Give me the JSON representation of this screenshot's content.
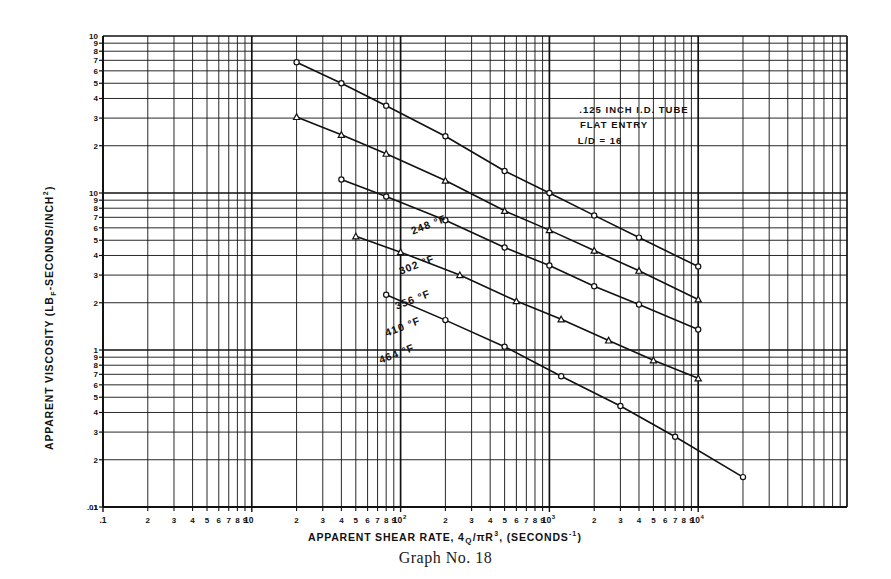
{
  "caption": "Graph No. 18",
  "chart_data": {
    "type": "line",
    "title": "",
    "xlabel": "APPARENT SHEAR RATE, 4Q/πR³, (SECONDS⁻¹)",
    "ylabel": "APPARENT VISCOSITY (LB F -SECONDS/INCH²)",
    "ylabel_parts": {
      "pre": "APPARENT VISCOSITY (LB",
      "sub": "F",
      "post": " -SECONDS/INCH",
      "sup": "2",
      "tail": " )"
    },
    "xlabel_parts": {
      "pre": "APPARENT SHEAR RATE, 4",
      "q": "Q",
      "slash": "/πR",
      "sup": "3",
      "post": ", (SECONDS",
      "sup2": "-1",
      "tail": ")"
    },
    "xscale": "log",
    "yscale": "log",
    "xlim": [
      0.1,
      10000
    ],
    "ylim": [
      0.01,
      10
    ],
    "grid": true,
    "legend_position": "inline-labels",
    "x_decade_labels": [
      ".1",
      "10",
      "10",
      "10",
      "10"
    ],
    "x_decade_exponents": [
      "",
      "",
      "2",
      "3",
      "4"
    ],
    "x_minor_labels": [
      "2",
      "3",
      "4",
      "5",
      "6",
      "7",
      "8",
      "9",
      "10"
    ],
    "y_tick_labels_top_decade": [
      "10",
      "9",
      "8",
      "7",
      "6",
      "5",
      "4",
      "3",
      "2"
    ],
    "y_tick_labels_mid_decade": [
      "1",
      "9",
      "8",
      "7",
      "6",
      "5",
      "4",
      "3",
      "2"
    ],
    "y_tick_labels_low_decade": [
      ".1",
      "9",
      "8",
      "7",
      "6",
      "5",
      "4",
      "3",
      "2"
    ],
    "y_bottom_label": ".01",
    "annotation": {
      "line1": ".125 INCH I.D. TUBE",
      "line2": "FLAT ENTRY",
      "line3": "L/D = 16"
    },
    "series": [
      {
        "name": "248 °F",
        "label": "248 °F",
        "marker": "circle",
        "x": [
          2,
          4,
          8,
          20,
          50,
          100,
          200,
          400,
          1000
        ],
        "y": [
          6.8,
          5.0,
          3.6,
          2.3,
          1.38,
          1.0,
          0.72,
          0.52,
          0.34
        ]
      },
      {
        "name": "302 °F",
        "label": "302 °F",
        "marker": "triangle",
        "x": [
          2,
          4,
          8,
          20,
          50,
          100,
          200,
          400,
          1000
        ],
        "y": [
          3.05,
          2.35,
          1.78,
          1.2,
          0.77,
          0.58,
          0.43,
          0.32,
          0.21
        ]
      },
      {
        "name": "356 °F",
        "label": "356 °F",
        "marker": "circle",
        "x": [
          4,
          8,
          20,
          50,
          100,
          200,
          400,
          1000
        ],
        "y": [
          1.22,
          0.95,
          0.67,
          0.45,
          0.345,
          0.255,
          0.195,
          0.135
        ]
      },
      {
        "name": "410 °F",
        "label": "410 °F",
        "marker": "triangle",
        "x": [
          5,
          10,
          25,
          60,
          120,
          250,
          500,
          1000
        ],
        "y": [
          0.53,
          0.42,
          0.3,
          0.205,
          0.157,
          0.115,
          0.086,
          0.066
        ]
      },
      {
        "name": "464 °F",
        "label": "464 °F",
        "marker": "circle",
        "x": [
          8,
          20,
          50,
          120,
          300,
          700,
          2000
        ],
        "y": [
          0.225,
          0.155,
          0.105,
          0.068,
          0.044,
          0.028,
          0.0155
        ]
      }
    ]
  }
}
